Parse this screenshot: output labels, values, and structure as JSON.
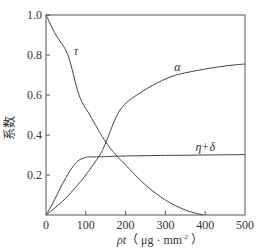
{
  "chart_data": {
    "type": "line",
    "title": "",
    "xlabel": "ρt（μg·mm⁻²）",
    "xlabel_var": "ρt",
    "xlabel_unit": "（ μg · mm",
    "xlabel_exp": "-2",
    "xlabel_close": " ）",
    "ylabel": "系数",
    "xlim": [
      0,
      500
    ],
    "ylim": [
      0,
      1.0
    ],
    "x_ticks": [
      0,
      100,
      200,
      300,
      400,
      500
    ],
    "y_ticks": [
      0.2,
      0.4,
      0.6,
      0.8,
      1.0
    ],
    "x_tick_labels": [
      "0",
      "100",
      "200",
      "300",
      "400",
      "500"
    ],
    "y_tick_labels": [
      "0.2",
      "0.4",
      "0.6",
      "0.8",
      "1.0"
    ],
    "grid": false,
    "legend": "none (inline curve labels)",
    "series": [
      {
        "name": "τ",
        "label_at": [
          75,
          0.8
        ],
        "x": [
          0,
          25,
          55,
          83,
          110,
          150,
          176,
          200,
          250,
          300,
          350,
          395
        ],
        "y": [
          1.0,
          0.9,
          0.8,
          0.6,
          0.5,
          0.365,
          0.3,
          0.25,
          0.15,
          0.075,
          0.025,
          0.0
        ]
      },
      {
        "name": "α",
        "label_at": [
          330,
          0.72
        ],
        "x": [
          0,
          25,
          50,
          75,
          100,
          135,
          151,
          186,
          236,
          312,
          387,
          450,
          500
        ],
        "y": [
          0.0,
          0.04,
          0.085,
          0.14,
          0.2,
          0.3,
          0.365,
          0.525,
          0.61,
          0.69,
          0.725,
          0.745,
          0.755
        ]
      },
      {
        "name": "η+δ",
        "label_at": [
          400,
          0.32
        ],
        "x": [
          0,
          20,
          40,
          60,
          80,
          100,
          110,
          150,
          200,
          300,
          400,
          500
        ],
        "y": [
          0.0,
          0.07,
          0.15,
          0.22,
          0.27,
          0.288,
          0.29,
          0.292,
          0.295,
          0.298,
          0.3,
          0.302
        ]
      }
    ]
  }
}
